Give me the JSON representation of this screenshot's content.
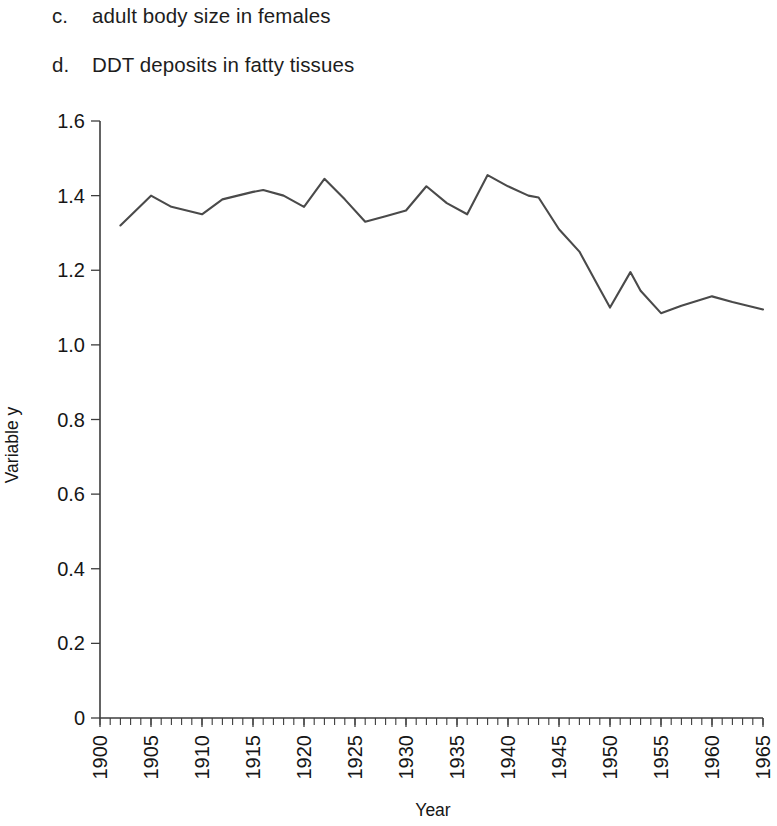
{
  "question_list": {
    "items": [
      {
        "marker": "c.",
        "text": "adult body size in females"
      },
      {
        "marker": "d.",
        "text": "DDT deposits in fatty tissues"
      }
    ]
  },
  "chart_data": {
    "type": "line",
    "title": "",
    "xlabel": "Year",
    "ylabel": "Variable y",
    "xlim": [
      1900,
      1965
    ],
    "ylim": [
      0,
      1.6
    ],
    "grid": false,
    "legend": null,
    "line_color": "#4a4a4a",
    "axis_color": "#3d3d3d",
    "x_major_step": 5,
    "x_minor_step": 1,
    "y_major_step": 0.2,
    "xticks": [
      1900,
      1905,
      1910,
      1915,
      1920,
      1925,
      1930,
      1935,
      1940,
      1945,
      1950,
      1955,
      1960,
      1965
    ],
    "xtick_labels": [
      "1900",
      "1905",
      "1910",
      "1915",
      "1920",
      "1925",
      "1930",
      "1935",
      "1940",
      "1945",
      "1950",
      "1955",
      "1960",
      "1965"
    ],
    "yticks": [
      0,
      0.2,
      0.4,
      0.6,
      0.8,
      1.0,
      1.2,
      1.4,
      1.6
    ],
    "ytick_labels": [
      "0",
      "0.2",
      "0.4",
      "0.6",
      "0.8",
      "1.0",
      "1.2",
      "1.4",
      "1.6"
    ],
    "series": [
      {
        "name": "Variable y",
        "x": [
          1902,
          1905,
          1907,
          1910,
          1912,
          1915,
          1916,
          1918,
          1920,
          1922,
          1924,
          1926,
          1928,
          1930,
          1932,
          1934,
          1936,
          1938,
          1940,
          1942,
          1943,
          1945,
          1947,
          1949,
          1950,
          1952,
          1953,
          1955,
          1957,
          1960,
          1962,
          1965
        ],
        "values": [
          1.32,
          1.4,
          1.37,
          1.35,
          1.39,
          1.41,
          1.415,
          1.4,
          1.37,
          1.445,
          1.39,
          1.33,
          1.345,
          1.36,
          1.425,
          1.38,
          1.35,
          1.455,
          1.425,
          1.4,
          1.395,
          1.31,
          1.25,
          1.15,
          1.1,
          1.195,
          1.145,
          1.085,
          1.105,
          1.13,
          1.115,
          1.095
        ]
      }
    ]
  }
}
